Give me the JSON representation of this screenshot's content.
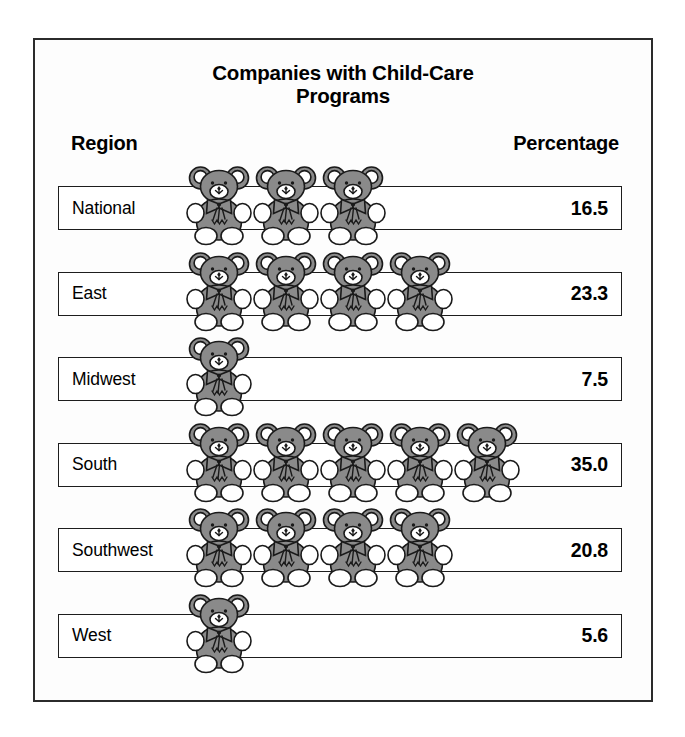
{
  "title": {
    "line1": "Companies with Child-Care",
    "line2": "Programs"
  },
  "headers": {
    "region": "Region",
    "percentage": "Percentage"
  },
  "colors": {
    "bear_body": "#8a8a8a",
    "bear_outline": "#1a1a1a",
    "bear_white": "#ffffff",
    "frame_border": "#2b2b2b",
    "row_border": "#1d1d1d",
    "background": "#ffffff"
  },
  "icon": {
    "name": "teddy-bear-icon",
    "unit_label": "teddy bear"
  },
  "chart_data": {
    "type": "bar",
    "subtype": "pictogram",
    "title": "Companies with Child-Care Programs",
    "xlabel": "Percentage",
    "ylabel": "Region",
    "categories": [
      "National",
      "East",
      "Midwest",
      "South",
      "Southwest",
      "West"
    ],
    "values": [
      16.5,
      23.3,
      7.5,
      35.0,
      20.8,
      5.6
    ],
    "icon_counts": [
      3,
      4,
      1,
      5,
      4,
      1
    ],
    "value_labels": [
      "16.5",
      "23.3",
      "7.5",
      "35.0",
      "20.8",
      "5.6"
    ],
    "legend": [],
    "grid": false,
    "xlim": [
      0,
      35
    ],
    "rows": [
      {
        "region": "National",
        "percentage": "16.5",
        "value": 16.5,
        "icons": 3
      },
      {
        "region": "East",
        "percentage": "23.3",
        "value": 23.3,
        "icons": 4
      },
      {
        "region": "Midwest",
        "percentage": "7.5",
        "value": 7.5,
        "icons": 1
      },
      {
        "region": "South",
        "percentage": "35.0",
        "value": 35.0,
        "icons": 5
      },
      {
        "region": "Southwest",
        "percentage": "20.8",
        "value": 20.8,
        "icons": 4
      },
      {
        "region": "West",
        "percentage": "5.6",
        "value": 5.6,
        "icons": 1
      }
    ]
  }
}
